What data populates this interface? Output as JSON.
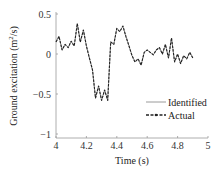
{
  "chart_data": {
    "type": "line",
    "title": "",
    "xlabel": "Time (s)",
    "ylabel": "Ground excitation (m²/s)",
    "ylabel_parts": {
      "main": "Ground excitation (m",
      "sup": "2",
      "tail": "/s)"
    },
    "xlim": [
      4,
      5
    ],
    "ylim": [
      -1,
      0.5
    ],
    "xticks": [
      4,
      4.2,
      4.4,
      4.6,
      4.8,
      5
    ],
    "xtick_labels": [
      "4",
      "4.2",
      "4.4",
      "4.6",
      "4.8",
      "5"
    ],
    "yticks": [
      0.5,
      0,
      -0.5,
      -1
    ],
    "ytick_labels": [
      "0.5",
      "0",
      "−0.5",
      "−1"
    ],
    "grid": false,
    "legend_position": "lower-right",
    "x": [
      4.0,
      4.02,
      4.04,
      4.06,
      4.08,
      4.1,
      4.12,
      4.14,
      4.16,
      4.18,
      4.2,
      4.22,
      4.24,
      4.26,
      4.28,
      4.3,
      4.32,
      4.34,
      4.36,
      4.38,
      4.4,
      4.42,
      4.44,
      4.46,
      4.48,
      4.5,
      4.52,
      4.54,
      4.56,
      4.58,
      4.6,
      4.62,
      4.64,
      4.66,
      4.68,
      4.7,
      4.72,
      4.74,
      4.76,
      4.78,
      4.8,
      4.82,
      4.84,
      4.86,
      4.88,
      4.9
    ],
    "series": [
      {
        "name": "Identified",
        "style": "solid",
        "color": "#9a9a9a",
        "values": [
          0.15,
          0.22,
          0.05,
          0.12,
          0.08,
          0.16,
          0.1,
          0.38,
          0.15,
          0.3,
          0.1,
          -0.05,
          -0.2,
          -0.55,
          -0.4,
          -0.58,
          -0.45,
          -0.58,
          0.15,
          0.12,
          0.32,
          0.28,
          0.35,
          0.22,
          0.1,
          -0.02,
          -0.1,
          -0.06,
          -0.14,
          0.02,
          0.05,
          0.02,
          -0.01,
          0.05,
          0.08,
          0.0,
          0.12,
          -0.05,
          0.2,
          -0.1,
          0.0,
          -0.12,
          -0.02,
          -0.06,
          0.02,
          -0.05
        ]
      },
      {
        "name": "Actual",
        "style": "dashed-dot",
        "color": "#222222",
        "values": [
          0.15,
          0.22,
          0.05,
          0.12,
          0.08,
          0.16,
          0.1,
          0.38,
          0.15,
          0.3,
          0.1,
          -0.05,
          -0.2,
          -0.55,
          -0.4,
          -0.58,
          -0.45,
          -0.58,
          0.15,
          0.12,
          0.32,
          0.28,
          0.35,
          0.22,
          0.1,
          -0.02,
          -0.1,
          -0.06,
          -0.14,
          0.02,
          0.05,
          0.02,
          -0.01,
          0.05,
          0.08,
          0.0,
          0.12,
          -0.05,
          0.2,
          -0.1,
          0.0,
          -0.12,
          -0.02,
          -0.06,
          0.02,
          -0.05
        ]
      }
    ]
  }
}
